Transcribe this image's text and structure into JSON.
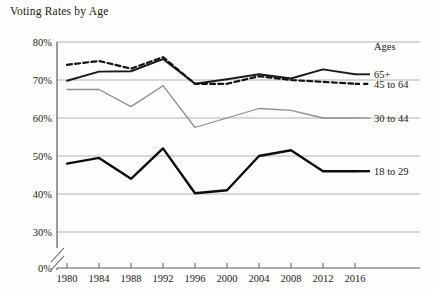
{
  "chart_data": {
    "type": "line",
    "title": "Voting Rates by Age",
    "xlabel": "",
    "ylabel": "",
    "categories": [
      "1980",
      "1984",
      "1988",
      "1992",
      "1996",
      "2000",
      "2004",
      "2008",
      "2012",
      "2016"
    ],
    "x": [
      1980,
      1984,
      1988,
      1992,
      1996,
      2000,
      2004,
      2008,
      2012,
      2016
    ],
    "ylim": [
      30,
      80
    ],
    "yticks": [
      "0%",
      "30%",
      "40%",
      "50%",
      "60%",
      "70%",
      "80%"
    ],
    "ytick_values": [
      0,
      30,
      40,
      50,
      60,
      70,
      80
    ],
    "axis_break": true,
    "grid": true,
    "legend_position": "right",
    "legend_title": "Ages",
    "series": [
      {
        "name": "65+",
        "style": "solid-dark",
        "color": "#1a1a1a",
        "values": [
          69.8,
          72.2,
          72.3,
          75.5,
          69.0,
          70.2,
          71.5,
          70.4,
          72.8,
          71.5
        ]
      },
      {
        "name": "45 to 64",
        "style": "dashed-dark",
        "color": "#111111",
        "values": [
          74.0,
          75.0,
          73.0,
          76.0,
          69.0,
          69.0,
          71.0,
          70.0,
          69.5,
          69.0
        ]
      },
      {
        "name": "30 to 44",
        "style": "solid-gray",
        "color": "#8d8d8d",
        "values": [
          67.5,
          67.5,
          63.0,
          68.5,
          57.5,
          60.0,
          62.5,
          62.0,
          60.0,
          60.0
        ]
      },
      {
        "name": "18 to 29",
        "style": "solid-black-thick",
        "color": "#0d0d0d",
        "values": [
          48.0,
          49.5,
          44.0,
          52.0,
          40.2,
          41.0,
          50.0,
          51.5,
          46.0,
          46.0
        ]
      }
    ]
  },
  "colors": {
    "grid": "#a9a9a9",
    "axis": "#5a5a5a",
    "text": "#1b1b1b",
    "background": "#fdfdfb"
  }
}
